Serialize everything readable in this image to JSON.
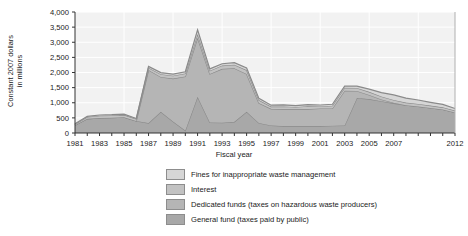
{
  "chart_data": {
    "type": "area",
    "stacked": true,
    "title": "",
    "xlabel": "Fiscal year",
    "ylabel": "Constant 2007 dollars in millions",
    "ylabel_lines": [
      "Constant 2007 dollars",
      "in millions"
    ],
    "ylim": [
      0,
      4000
    ],
    "ytick_values": [
      0,
      500,
      1000,
      1500,
      2000,
      2500,
      3000,
      3500,
      4000
    ],
    "ytick_labels": [
      "0",
      "500",
      "1,000",
      "1,500",
      "2,000",
      "2,500",
      "3,000",
      "3,500",
      "4,000"
    ],
    "grid": true,
    "legend_position": "bottom",
    "x": [
      1981,
      1982,
      1983,
      1984,
      1985,
      1986,
      1987,
      1988,
      1989,
      1990,
      1991,
      1992,
      1993,
      1994,
      1995,
      1996,
      1997,
      1998,
      1999,
      2000,
      2001,
      2002,
      2003,
      2004,
      2005,
      2006,
      2007,
      2008,
      2009,
      2010,
      2011,
      2012
    ],
    "xtick_labels": [
      "1981",
      "1983",
      "1985",
      "1987",
      "1989",
      "1991",
      "1993",
      "1995",
      "1997",
      "1999",
      "2001",
      "2003",
      "2005",
      "2007",
      "2012"
    ],
    "xtick_values": [
      1981,
      1983,
      1985,
      1987,
      1989,
      1991,
      1993,
      1995,
      1997,
      1999,
      2001,
      2003,
      2005,
      2007,
      2012
    ],
    "series": [
      {
        "name": "General fund (taxes paid by public)",
        "color": "#a8a8a8",
        "values": [
          260,
          470,
          500,
          505,
          520,
          400,
          330,
          700,
          380,
          80,
          1200,
          350,
          340,
          370,
          700,
          330,
          250,
          230,
          230,
          230,
          230,
          240,
          250,
          1160,
          1120,
          1050,
          980,
          920,
          880,
          830,
          780,
          680
        ]
      },
      {
        "name": "Dedicated funds (taxes on hazardous waste producers)",
        "color": "#b5b5b5",
        "values": [
          0,
          0,
          0,
          0,
          0,
          0,
          1750,
          1150,
          1420,
          1790,
          1950,
          1600,
          1780,
          1770,
          1250,
          660,
          550,
          560,
          560,
          560,
          580,
          570,
          1150,
          230,
          140,
          60,
          20,
          0,
          0,
          0,
          0,
          0
        ]
      },
      {
        "name": "Interest",
        "color": "#c2c2c2",
        "values": [
          30,
          60,
          70,
          75,
          80,
          60,
          80,
          95,
          95,
          100,
          120,
          110,
          110,
          120,
          130,
          100,
          75,
          90,
          70,
          95,
          70,
          90,
          95,
          100,
          100,
          95,
          90,
          85,
          80,
          75,
          70,
          60
        ]
      },
      {
        "name": "Fines for inappropriate waste management",
        "color": "#d6d6d6",
        "values": [
          15,
          20,
          25,
          25,
          25,
          20,
          40,
          50,
          50,
          55,
          140,
          60,
          60,
          65,
          70,
          55,
          45,
          50,
          45,
          55,
          45,
          50,
          55,
          60,
          90,
          130,
          170,
          150,
          130,
          110,
          95,
          70
        ]
      }
    ],
    "legend_entries": [
      {
        "label": "Fines for inappropriate waste management",
        "color": "#d6d6d6"
      },
      {
        "label": "Interest",
        "color": "#c2c2c2"
      },
      {
        "label": "Dedicated funds (taxes on hazardous waste producers)",
        "color": "#b5b5b5"
      },
      {
        "label": "General fund (taxes paid by public)",
        "color": "#a8a8a8"
      }
    ]
  }
}
